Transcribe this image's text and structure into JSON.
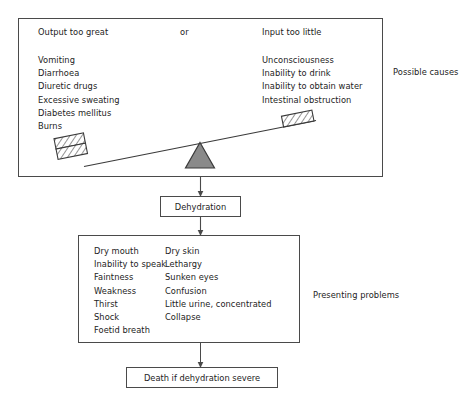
{
  "diagram": {
    "colors": {
      "stroke": "#4a4a4a",
      "text": "#232323",
      "fulcrum_fill": "#8a8a8a",
      "hatch": "#3a3a3a",
      "background": "#ffffff"
    }
  },
  "causes": {
    "heading_left": "Output too great",
    "heading_conjunction": "or",
    "heading_right": "Input too little",
    "left_items": [
      "Vomiting",
      "Diarrhoea",
      "Diuretic drugs",
      "Excessive sweating",
      "Diabetes mellitus",
      "Burns"
    ],
    "right_items": [
      "Unconsciousness",
      "Inability to drink",
      "Inability to obtain water",
      "Intestinal obstruction"
    ],
    "side_label": "Possible causes",
    "seesaw": {
      "left_weight_blocks": 2,
      "right_weight_blocks": 1,
      "tilt": "down-to-the-left",
      "fulcrum_shape": "triangle"
    }
  },
  "dehydration": {
    "label": "Dehydration"
  },
  "problems": {
    "left_items": [
      "Dry mouth",
      "Inability to speak",
      "Faintness",
      "Weakness",
      "Thirst",
      "Shock",
      "Foetid breath"
    ],
    "right_items": [
      "Dry skin",
      "Lethargy",
      "Sunken eyes",
      "Confusion",
      "Little urine, concentrated",
      "Collapse"
    ],
    "side_label": "Presenting problems"
  },
  "outcome": {
    "label": "Death if dehydration severe"
  },
  "arrows": [
    {
      "name": "causes-to-dehydration",
      "from": "causes-box",
      "to": "dehydration-box"
    },
    {
      "name": "dehydration-to-problems",
      "from": "dehydration-box",
      "to": "problems-box"
    },
    {
      "name": "problems-to-death",
      "from": "problems-box",
      "to": "death-box"
    }
  ]
}
